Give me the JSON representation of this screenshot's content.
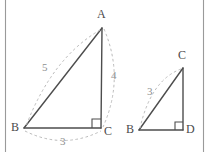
{
  "figure": {
    "background_color": "#ffffff",
    "solid_stroke_color": "#4d4d4d",
    "dashed_stroke_color": "#bbbbbb",
    "rule_color": "#9a9a9a",
    "vertex_label_color": "#4a4a4a",
    "measure_label_color": "#8f8f8f"
  },
  "page_rules": {
    "left_rule": "|",
    "right_rule": "|"
  },
  "triangle_large": {
    "name": "triangle-ABC",
    "vertices": [
      {
        "id": "A",
        "label": "A",
        "x": 102,
        "y": 28,
        "label_x": 97,
        "label_y": 8
      },
      {
        "id": "B",
        "label": "B",
        "x": 24,
        "y": 128,
        "label_x": 11,
        "label_y": 121
      },
      {
        "id": "C",
        "label": "C",
        "x": 101,
        "y": 128,
        "label_x": 104,
        "label_y": 125
      }
    ],
    "right_angle_at": "C",
    "measures": [
      {
        "id": "AB",
        "label": "5",
        "label_x": 42,
        "label_y": 62
      },
      {
        "id": "AC",
        "label": "4",
        "label_x": 111,
        "label_y": 70
      },
      {
        "id": "BC",
        "label": "3",
        "label_x": 60,
        "label_y": 136
      }
    ]
  },
  "triangle_small": {
    "name": "triangle-BCD",
    "vertices": [
      {
        "id": "C",
        "label": "C",
        "x": 183,
        "y": 68,
        "label_x": 178,
        "label_y": 49
      },
      {
        "id": "B",
        "label": "B",
        "x": 139,
        "y": 130,
        "label_x": 126,
        "label_y": 123
      },
      {
        "id": "D",
        "label": "D",
        "x": 183,
        "y": 130,
        "label_x": 186,
        "label_y": 123
      }
    ],
    "right_angle_at": "D",
    "measures": [
      {
        "id": "BC",
        "label": "3",
        "label_x": 147,
        "label_y": 86
      }
    ]
  }
}
